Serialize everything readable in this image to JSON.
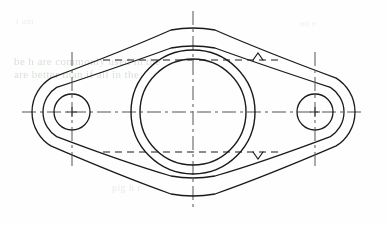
{
  "document": {
    "title": "Two-Bolt Oval Flange Gasket",
    "view_type": "orthographic-front-view",
    "background_color": "#fefefe",
    "line_color": "#1a1a1a",
    "centerline_color": "#555555"
  },
  "drawing": {
    "canvas": {
      "width": 386,
      "height": 225
    },
    "center": {
      "x": 193,
      "y": 112
    },
    "outer_body": {
      "name": "flange-outer-profile",
      "description": "Elongated lens profile with rounded bosses at both ends",
      "left_boss_center": {
        "x": 72,
        "y": 112
      },
      "right_boss_center": {
        "x": 315,
        "y": 112
      },
      "boss_radius": 40,
      "top_apex": {
        "x": 193,
        "y": 29
      },
      "bottom_apex": {
        "x": 193,
        "y": 195
      },
      "stroke_width": 1.3
    },
    "inner_body": {
      "name": "flange-inner-profile",
      "description": "Offset inner wall outline parallel to outer profile",
      "left_boss_center": {
        "x": 72,
        "y": 112
      },
      "right_boss_center": {
        "x": 315,
        "y": 112
      },
      "boss_radius": 29,
      "top_apex": {
        "x": 193,
        "y": 47
      },
      "bottom_apex": {
        "x": 193,
        "y": 177
      },
      "stroke_width": 1.3
    },
    "central_bore": {
      "name": "central-bore",
      "outer_circle": {
        "cx": 193,
        "cy": 112,
        "r": 62
      },
      "inner_circle": {
        "cx": 193,
        "cy": 112,
        "r": 53
      },
      "stroke_width": 1.4
    },
    "bolt_holes": [
      {
        "name": "bolt-hole-left",
        "cx": 72,
        "cy": 112,
        "hole_radius": 18,
        "boss_radius": 29,
        "centerline_vertical": {
          "y1": 52,
          "y2": 166
        },
        "cross_mark_size": 5
      },
      {
        "name": "bolt-hole-right",
        "cx": 315,
        "cy": 112,
        "hole_radius": 18,
        "boss_radius": 29,
        "centerline_vertical": {
          "y1": 52,
          "y2": 166
        },
        "cross_mark_size": 5
      }
    ],
    "centerlines": {
      "horizontal": {
        "x1": 22,
        "x2": 364,
        "y": 112
      },
      "vertical": {
        "x": 193,
        "y1": 11,
        "y2": 207
      },
      "dash_pattern": "14 4 3 4",
      "stroke_width": 1.0
    },
    "section_lines": [
      {
        "name": "section-line-upper",
        "label": "A",
        "y": 60,
        "x1": 103,
        "x2": 278,
        "arrow_x": 258,
        "arrow_direction": "up",
        "dash_pattern": "7 5"
      },
      {
        "name": "section-line-lower",
        "label": "A",
        "y": 152,
        "x1": 103,
        "x2": 278,
        "arrow_x": 258,
        "arrow_direction": "down",
        "dash_pattern": "7 5"
      }
    ]
  },
  "bleed_through": {
    "note": "Faint greenish text showing through from the reverse side of the page",
    "line1": "be h are commonly used in the",
    "line2": "are better than if all in the",
    "line3": "pig h r",
    "line4": "t um",
    "line5": "an e"
  }
}
